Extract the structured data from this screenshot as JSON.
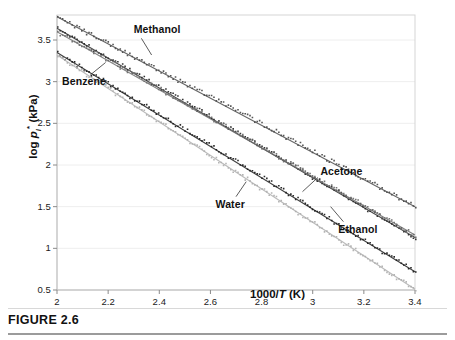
{
  "figure": {
    "caption": "FIGURE 2.6"
  },
  "chart_data": {
    "type": "line",
    "title": "",
    "xlabel": "1000/T (K)",
    "ylabel": "log pᵢ* (kPa)",
    "xlabel_html": "1000/<i>T</i> (K)",
    "ylabel_html": "log <i>p</i><sub>i</sub><sup>*</sup> (kPa)",
    "xlim": [
      2,
      3.4
    ],
    "ylim": [
      0.5,
      3.8
    ],
    "xticks": [
      "2",
      "2.2",
      "2.4",
      "2.6",
      "2.8",
      "3",
      "3.2",
      "3.4"
    ],
    "xtick_values": [
      2,
      2.2,
      2.4,
      2.6,
      2.8,
      3,
      3.2,
      3.4
    ],
    "yticks": [
      "0.5",
      "1",
      "1.5",
      "2",
      "2.5",
      "3",
      "3.5"
    ],
    "ytick_values": [
      0.5,
      1,
      1.5,
      2,
      2.5,
      3,
      3.5
    ],
    "grid": "horizontal-faint",
    "legend": "inline-callout-labels",
    "series": [
      {
        "name": "Acetone",
        "color": "#4d4d4d",
        "label_x": 3.03,
        "label_y": 1.92,
        "leader": [
          [
            3.02,
            1.85
          ],
          [
            2.96,
            1.68
          ]
        ],
        "x": [
          2.0,
          2.2,
          2.4,
          2.6,
          2.8,
          3.0,
          3.2,
          3.4
        ],
        "y": [
          3.78,
          3.46,
          3.14,
          2.82,
          2.5,
          2.17,
          1.84,
          1.5
        ]
      },
      {
        "name": "Methanol",
        "color": "#2b2b2b",
        "label_x": 2.3,
        "label_y": 3.62,
        "leader": [
          [
            2.33,
            3.52
          ],
          [
            2.37,
            3.32
          ]
        ],
        "x": [
          2.0,
          2.2,
          2.4,
          2.6,
          2.8,
          3.0,
          3.2,
          3.4
        ],
        "y": [
          3.64,
          3.29,
          2.94,
          2.58,
          2.22,
          1.86,
          1.5,
          1.13
        ]
      },
      {
        "name": "Benzene",
        "color": "#6e6e6e",
        "label_x": 2.02,
        "label_y": 3.0,
        "leader": [
          [
            2.13,
            3.08
          ],
          [
            2.19,
            3.23
          ]
        ],
        "x": [
          2.0,
          2.2,
          2.4,
          2.6,
          2.8,
          3.0,
          3.2,
          3.4
        ],
        "y": [
          3.6,
          3.26,
          2.92,
          2.57,
          2.22,
          1.87,
          1.52,
          1.16
        ]
      },
      {
        "name": "Ethanol",
        "color": "#1f1f1f",
        "label_x": 3.1,
        "label_y": 1.22,
        "leader": [
          [
            3.12,
            1.32
          ],
          [
            3.07,
            1.5
          ]
        ],
        "x": [
          2.0,
          2.2,
          2.4,
          2.6,
          2.8,
          3.0,
          3.2,
          3.4
        ],
        "y": [
          3.35,
          2.98,
          2.61,
          2.24,
          1.86,
          1.48,
          1.1,
          0.72
        ]
      },
      {
        "name": "Water",
        "color": "#b0b0b0",
        "label_x": 2.62,
        "label_y": 1.52,
        "leader": [
          [
            2.7,
            1.62
          ],
          [
            2.74,
            1.8
          ]
        ],
        "x": [
          2.0,
          2.2,
          2.4,
          2.6,
          2.8,
          3.0,
          3.2,
          3.4
        ],
        "y": [
          3.32,
          2.92,
          2.52,
          2.12,
          1.72,
          1.31,
          0.91,
          0.51
        ]
      }
    ]
  }
}
